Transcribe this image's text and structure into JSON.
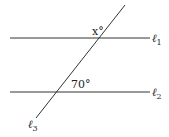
{
  "diagram": {
    "type": "parallel lines cut by a transversal",
    "lines": [
      {
        "name": "ℓ",
        "subscript": "1",
        "role": "parallel line (top)"
      },
      {
        "name": "ℓ",
        "subscript": "2",
        "role": "parallel line (bottom)"
      },
      {
        "name": "ℓ",
        "subscript": "3",
        "role": "transversal"
      }
    ],
    "angles": [
      {
        "label": "x°",
        "position": "above ℓ1, left of transversal"
      },
      {
        "label": "70°",
        "position": "above ℓ2, right of transversal"
      }
    ],
    "colors": {
      "stroke": "#333333",
      "text": "#222222"
    }
  }
}
